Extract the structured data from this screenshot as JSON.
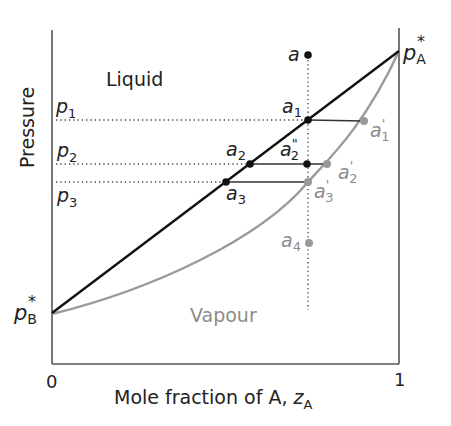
{
  "diagram": {
    "type": "phase-diagram",
    "y_axis_label": "Pressure",
    "x_axis_label": "Mole fraction of A, ",
    "x_axis_var": "z",
    "x_axis_var_sub": "A",
    "x_tick_min": "0",
    "x_tick_max": "1",
    "region_liquid": "Liquid",
    "region_vapour": "Vapour",
    "pA_star": {
      "main": "p",
      "sub": "A",
      "sup": "*"
    },
    "pB_star": {
      "main": "p",
      "sub": "B",
      "sup": "*"
    },
    "pressures": [
      {
        "main": "p",
        "sub": "1"
      },
      {
        "main": "p",
        "sub": "2"
      },
      {
        "main": "p",
        "sub": "3"
      }
    ],
    "points": {
      "a": {
        "main": "a"
      },
      "a1": {
        "main": "a",
        "sub": "1"
      },
      "a1p": {
        "main": "a",
        "sub": "1",
        "prime": "'"
      },
      "a2": {
        "main": "a",
        "sub": "2"
      },
      "a2pp": {
        "main": "a",
        "sub": "2",
        "prime": "\""
      },
      "a2p": {
        "main": "a",
        "sub": "2",
        "prime": "'"
      },
      "a3": {
        "main": "a",
        "sub": "3"
      },
      "a3p": {
        "main": "a",
        "sub": "3",
        "prime": "'"
      },
      "a4": {
        "main": "a",
        "sub": "4"
      }
    },
    "colors": {
      "liquid_line": "#111111",
      "vapour_line": "#999999",
      "axis": "#555555",
      "text": "#222222",
      "grey_text": "#8c8c8c"
    }
  }
}
